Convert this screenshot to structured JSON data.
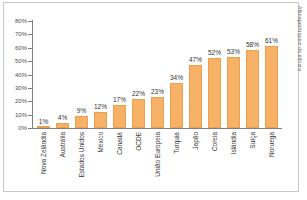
{
  "chart_data": {
    "type": "bar",
    "title": "",
    "xlabel": "",
    "ylabel": "",
    "ylim": [
      0,
      80
    ],
    "grid": false,
    "legend": null,
    "y_ticks": [
      "0%",
      "10%",
      "20%",
      "30%",
      "40%",
      "50%",
      "60%",
      "70%",
      "80%"
    ],
    "y_tick_values": [
      0,
      10,
      20,
      30,
      40,
      50,
      60,
      70,
      80
    ],
    "categories": [
      "Nova Zelândia",
      "Austrália",
      "Estados Unidos",
      "México",
      "Canadá",
      "OCDE",
      "União Europeia",
      "Turquia",
      "Japão",
      "Coreia",
      "Islândia",
      "Suíça",
      "Noruega"
    ],
    "values": [
      1,
      4,
      9,
      12,
      17,
      22,
      23,
      34,
      47,
      52,
      53,
      58,
      61
    ],
    "value_labels": [
      "1%",
      "4%",
      "9%",
      "12%",
      "17%",
      "22%",
      "23%",
      "34%",
      "47%",
      "52%",
      "53%",
      "58%",
      "61%"
    ],
    "bar_color": "#f7b267",
    "axis_color": "#808080"
  },
  "credit": {
    "text": "Afimape/Arquivo da editora"
  },
  "caption": {
    "text": ""
  }
}
